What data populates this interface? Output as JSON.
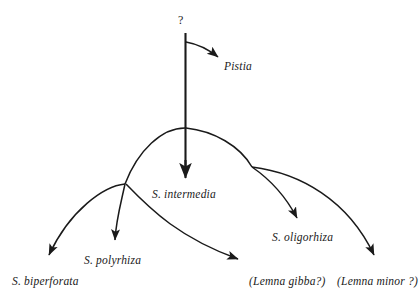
{
  "diagram": {
    "type": "phylogenetic-tree",
    "background_color": "#ffffff",
    "line_color": "#1a1a1a",
    "root": {
      "label": "?",
      "x": 181,
      "y": 22
    },
    "taxa": [
      {
        "id": "pistia",
        "label": "Pistia",
        "x": 224,
        "y": 68,
        "arrow_tip_x": 221,
        "arrow_tip_y": 61
      },
      {
        "id": "s-intermedia",
        "label": "S. intermedia",
        "x": 152,
        "y": 196,
        "arrow_tip_x": 186,
        "arrow_tip_y": 180
      },
      {
        "id": "s-polyrhiza",
        "label": "S. polyrhiza",
        "x": 84,
        "y": 262,
        "arrow_tip_x": 115,
        "arrow_tip_y": 246
      },
      {
        "id": "s-biperforata",
        "label": "S. biperforata",
        "x": 12,
        "y": 283,
        "arrow_tip_x": 46,
        "arrow_tip_y": 262
      },
      {
        "id": "s-oligorhiza",
        "label": "S. oligorhiza",
        "x": 272,
        "y": 239,
        "arrow_tip_x": 300,
        "arrow_tip_y": 224
      },
      {
        "id": "lemna-gibba",
        "label": "(Lemna gibba?)",
        "x": 249,
        "y": 283,
        "arrow_tip_x": 245,
        "arrow_tip_y": 264
      },
      {
        "id": "lemna-minor",
        "label": "(Lemna minor ?)",
        "x": 337,
        "y": 283,
        "arrow_tip_x": 378,
        "arrow_tip_y": 262
      }
    ]
  }
}
